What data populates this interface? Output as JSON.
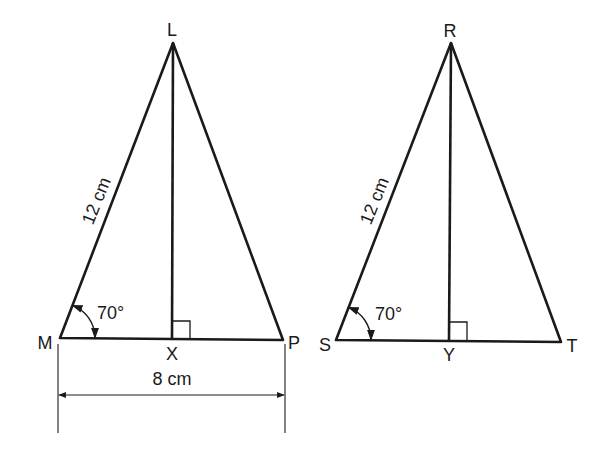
{
  "diagram": {
    "triangle_left": {
      "apex": "L",
      "base_left": "M",
      "base_right": "P",
      "foot": "X",
      "side_label": "12 cm",
      "angle_label": "70°",
      "base_label": "8 cm"
    },
    "triangle_right": {
      "apex": "R",
      "base_left": "S",
      "base_right": "T",
      "foot": "Y",
      "side_label": "12 cm",
      "angle_label": "70°"
    },
    "colors": {
      "line": "#1a1a1a",
      "background": "#ffffff"
    }
  }
}
